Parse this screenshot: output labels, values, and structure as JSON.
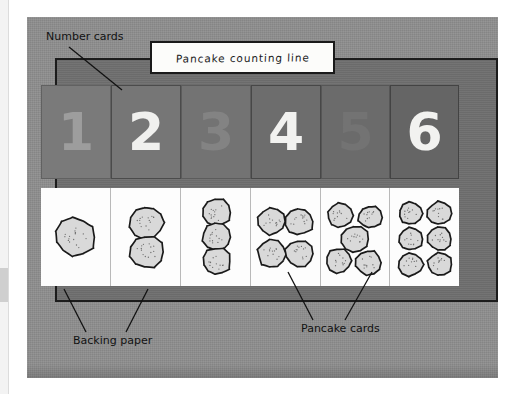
{
  "figure": {
    "title_sign": "Pancake counting line",
    "annotations": [
      {
        "name": "number-cards",
        "text": "Number cards"
      },
      {
        "name": "backing-paper",
        "text": "Backing paper"
      },
      {
        "name": "pancake-cards",
        "text": "Pancake cards"
      }
    ]
  },
  "colors": {
    "photo_background": "#8e8e8e",
    "board_background": "#6f6f6f",
    "board_border": "#1c1c1c",
    "card_white": "#fdfdfd",
    "pancake_fill": "#d9d9d9",
    "pancake_outline": "#1a1a1a",
    "sign_background": "#fcfcfa",
    "label_text": "#121212"
  },
  "number_cards": [
    {
      "value": "1",
      "card_color": "#7a7a7a",
      "digit_color": "#9d9d9d",
      "contrast": "low"
    },
    {
      "value": "2",
      "card_color": "#767676",
      "digit_color": "#f0f0ee",
      "contrast": "high"
    },
    {
      "value": "3",
      "card_color": "#737373",
      "digit_color": "#838383",
      "contrast": "low"
    },
    {
      "value": "4",
      "card_color": "#6d6d6d",
      "digit_color": "#f2f2f0",
      "contrast": "high"
    },
    {
      "value": "5",
      "card_color": "#6b6b6b",
      "digit_color": "#737373",
      "contrast": "low"
    },
    {
      "value": "6",
      "card_color": "#656565",
      "digit_color": "#f2f2f0",
      "contrast": "high"
    }
  ],
  "pancake_cards": [
    {
      "count": 1,
      "layout": "single-large"
    },
    {
      "count": 2,
      "layout": "vertical-column"
    },
    {
      "count": 3,
      "layout": "vertical-column"
    },
    {
      "count": 4,
      "layout": "two-by-two-grid"
    },
    {
      "count": 5,
      "layout": "quincunx"
    },
    {
      "count": 6,
      "layout": "three-by-two-grid"
    }
  ]
}
